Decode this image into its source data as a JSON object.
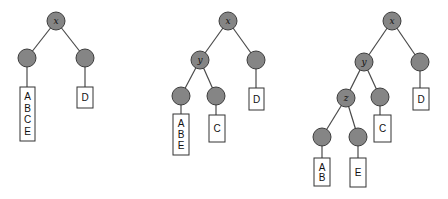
{
  "diagram": {
    "type": "tree-sequence",
    "colors": {
      "node_fill": "#858585",
      "node_stroke": "#3d3d3d",
      "edge": "#4a4a4a",
      "box_stroke": "#333333"
    },
    "node_radius": 9,
    "trees": [
      {
        "id": "tree-1",
        "nodes": [
          {
            "id": "t1-root",
            "label": "x",
            "cx": 56,
            "cy": 21
          },
          {
            "id": "t1-left",
            "label": "",
            "cx": 27,
            "cy": 58
          },
          {
            "id": "t1-right",
            "label": "",
            "cx": 85,
            "cy": 58
          }
        ],
        "edges": [
          [
            "t1-root",
            "t1-left"
          ],
          [
            "t1-root",
            "t1-right"
          ]
        ],
        "leaves": [
          {
            "id": "t1-box-abce",
            "parent": "t1-left",
            "x": 20,
            "y": 87,
            "w": 15,
            "h": 54,
            "items": [
              "A",
              "B",
              "C",
              "E"
            ]
          },
          {
            "id": "t1-box-d",
            "parent": "t1-right",
            "x": 77,
            "y": 87,
            "w": 16,
            "h": 21,
            "items": [
              "D"
            ]
          }
        ]
      },
      {
        "id": "tree-2",
        "nodes": [
          {
            "id": "t2-root",
            "label": "x",
            "cx": 228,
            "cy": 21
          },
          {
            "id": "t2-y",
            "label": "y",
            "cx": 200,
            "cy": 60
          },
          {
            "id": "t2-right",
            "label": "",
            "cx": 256,
            "cy": 60
          },
          {
            "id": "t2-ll",
            "label": "",
            "cx": 181,
            "cy": 96
          },
          {
            "id": "t2-lr",
            "label": "",
            "cx": 216,
            "cy": 96
          }
        ],
        "edges": [
          [
            "t2-root",
            "t2-y"
          ],
          [
            "t2-root",
            "t2-right"
          ],
          [
            "t2-y",
            "t2-ll"
          ],
          [
            "t2-y",
            "t2-lr"
          ]
        ],
        "leaves": [
          {
            "id": "t2-box-abe",
            "parent": "t2-ll",
            "x": 173,
            "y": 114,
            "w": 16,
            "h": 41,
            "items": [
              "A",
              "B",
              "E"
            ]
          },
          {
            "id": "t2-box-c",
            "parent": "t2-lr",
            "x": 209,
            "y": 115,
            "w": 16,
            "h": 27,
            "items": [
              "C"
            ]
          },
          {
            "id": "t2-box-d",
            "parent": "t2-right",
            "x": 249,
            "y": 88,
            "w": 15,
            "h": 22,
            "items": [
              "D"
            ]
          }
        ]
      },
      {
        "id": "tree-3",
        "nodes": [
          {
            "id": "t3-root",
            "label": "x",
            "cx": 392,
            "cy": 21
          },
          {
            "id": "t3-y",
            "label": "y",
            "cx": 364,
            "cy": 62
          },
          {
            "id": "t3-right",
            "label": "",
            "cx": 420,
            "cy": 62
          },
          {
            "id": "t3-z",
            "label": "z",
            "cx": 346,
            "cy": 98
          },
          {
            "id": "t3-c",
            "label": "",
            "cx": 380,
            "cy": 97
          },
          {
            "id": "t3-ab",
            "label": "",
            "cx": 322,
            "cy": 137
          },
          {
            "id": "t3-e",
            "label": "",
            "cx": 358,
            "cy": 137
          }
        ],
        "edges": [
          [
            "t3-root",
            "t3-y"
          ],
          [
            "t3-root",
            "t3-right"
          ],
          [
            "t3-y",
            "t3-z"
          ],
          [
            "t3-y",
            "t3-c"
          ],
          [
            "t3-z",
            "t3-ab"
          ],
          [
            "t3-z",
            "t3-e"
          ]
        ],
        "leaves": [
          {
            "id": "t3-box-ab",
            "parent": "t3-ab",
            "x": 314,
            "y": 158,
            "w": 16,
            "h": 28,
            "items": [
              "A",
              "B"
            ]
          },
          {
            "id": "t3-box-e",
            "parent": "t3-e",
            "x": 350,
            "y": 158,
            "w": 16,
            "h": 29,
            "items": [
              "E"
            ]
          },
          {
            "id": "t3-box-c",
            "parent": "t3-c",
            "x": 374,
            "y": 115,
            "w": 17,
            "h": 27,
            "items": [
              "C"
            ]
          },
          {
            "id": "t3-box-d",
            "parent": "t3-right",
            "x": 413,
            "y": 88,
            "w": 16,
            "h": 22,
            "items": [
              "D"
            ]
          }
        ]
      }
    ]
  }
}
